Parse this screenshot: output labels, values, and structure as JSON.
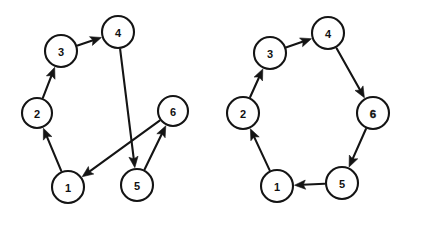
{
  "figure": {
    "background_color": "#ffffff",
    "stroke_color": "#141414",
    "node_fill_color": "#ffffff",
    "label_color": "#111111"
  },
  "diagrams": [
    {
      "id": "left-graph",
      "name": "non-hamiltonian-ordering-graph",
      "nodes": [
        {
          "id": "n1",
          "label": "1",
          "cx": 68,
          "cy": 187,
          "r": 16,
          "emphasis": "normal"
        },
        {
          "id": "n2",
          "label": "2",
          "cx": 37,
          "cy": 113,
          "r": 15,
          "emphasis": "normal"
        },
        {
          "id": "n3",
          "label": "3",
          "cx": 61,
          "cy": 51,
          "r": 16,
          "emphasis": "normal"
        },
        {
          "id": "n4",
          "label": "4",
          "cx": 118,
          "cy": 32,
          "r": 16,
          "emphasis": "normal"
        },
        {
          "id": "n5",
          "label": "5",
          "cx": 137,
          "cy": 185,
          "r": 16,
          "emphasis": "normal"
        },
        {
          "id": "n6",
          "label": "6",
          "cx": 173,
          "cy": 111,
          "r": 15,
          "emphasis": "normal"
        }
      ],
      "edges": [
        {
          "id": "e1",
          "from": "n1",
          "to": "n2",
          "label": "1-to-2"
        },
        {
          "id": "e2",
          "from": "n2",
          "to": "n3",
          "label": "2-to-3"
        },
        {
          "id": "e3",
          "from": "n3",
          "to": "n4",
          "label": "3-to-4"
        },
        {
          "id": "e4",
          "from": "n4",
          "to": "n5",
          "label": "4-to-5"
        },
        {
          "id": "e5",
          "from": "n5",
          "to": "n6",
          "label": "5-to-6"
        },
        {
          "id": "e6",
          "from": "n6",
          "to": "n1",
          "label": "6-to-1"
        }
      ]
    },
    {
      "id": "right-graph",
      "name": "hamiltonian-cycle-graph",
      "nodes": [
        {
          "id": "m1",
          "label": "1",
          "cx": 277,
          "cy": 186,
          "r": 16,
          "emphasis": "normal"
        },
        {
          "id": "m2",
          "label": "2",
          "cx": 243,
          "cy": 113,
          "r": 16,
          "emphasis": "normal"
        },
        {
          "id": "m3",
          "label": "3",
          "cx": 270,
          "cy": 53,
          "r": 16,
          "emphasis": "normal"
        },
        {
          "id": "m4",
          "label": "4",
          "cx": 328,
          "cy": 33,
          "r": 16,
          "emphasis": "normal"
        },
        {
          "id": "m5",
          "label": "5",
          "cx": 342,
          "cy": 183,
          "r": 16,
          "emphasis": "normal"
        },
        {
          "id": "m6",
          "label": "6",
          "cx": 373,
          "cy": 113,
          "r": 16,
          "emphasis": "bold"
        }
      ],
      "edges": [
        {
          "id": "f1",
          "from": "m1",
          "to": "m2",
          "label": "1-to-2"
        },
        {
          "id": "f2",
          "from": "m2",
          "to": "m3",
          "label": "2-to-3"
        },
        {
          "id": "f3",
          "from": "m3",
          "to": "m4",
          "label": "3-to-4"
        },
        {
          "id": "f4",
          "from": "m4",
          "to": "m6",
          "label": "4-to-6"
        },
        {
          "id": "f5",
          "from": "m6",
          "to": "m5",
          "label": "6-to-5"
        },
        {
          "id": "f6",
          "from": "m5",
          "to": "m1",
          "label": "5-to-1"
        }
      ]
    }
  ]
}
